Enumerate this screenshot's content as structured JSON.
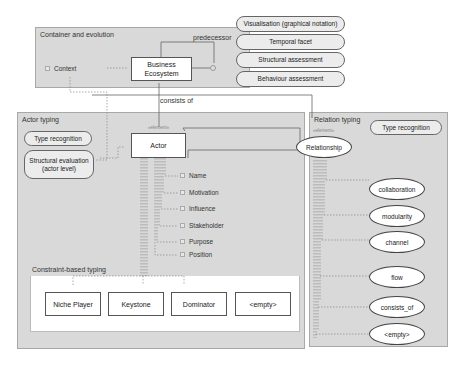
{
  "container_evolution": {
    "title": "Container and evolution",
    "context_label": "Context",
    "business_ecosystem": "Business\nEcosystem",
    "predecessor_label": "predecessor"
  },
  "facets": [
    {
      "label": "Visualisation (graphical notation)"
    },
    {
      "label": "Temporal facet"
    },
    {
      "label": "Structural assessment"
    },
    {
      "label": "Behaviour assessment"
    }
  ],
  "consists_of_label": "consists of",
  "actor_typing": {
    "title": "Actor typing",
    "type_recognition": "Type recognition",
    "structural_evaluation": "Structural evaluation\n(actor level)",
    "actor_stereotype": "«element»",
    "actor_label": "Actor",
    "attributes": [
      {
        "label": "Name"
      },
      {
        "label": "Motivation"
      },
      {
        "label": "Influence"
      },
      {
        "label": "Stakeholder"
      },
      {
        "label": "Purpose"
      },
      {
        "label": "Position"
      }
    ],
    "constraint_title": "Constraint-based typing",
    "constraint_types": [
      {
        "label": "Niche Player"
      },
      {
        "label": "Keystone"
      },
      {
        "label": "Dominator"
      },
      {
        "label": "<empty>"
      }
    ]
  },
  "relation_typing": {
    "title": "Relation typing",
    "type_recognition": "Type recognition",
    "relationship_stereotype": "«element»",
    "relationship_label": "Relationship",
    "relation_types": [
      {
        "label": "collaboration"
      },
      {
        "label": "modularity"
      },
      {
        "label": "channel"
      },
      {
        "label": "flow"
      },
      {
        "label": "consists_of"
      },
      {
        "label": "<empty>"
      }
    ]
  },
  "colors": {
    "package_fill": "#d9d9d9",
    "node_fill": "#ffffff",
    "pill_fill": "#ececec"
  }
}
